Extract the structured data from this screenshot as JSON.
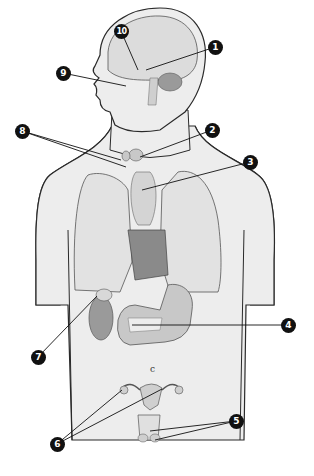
{
  "diagram": {
    "colors": {
      "skin_fill": "#ededed",
      "outline": "#2a2a2a",
      "organ_fill": "#cfcfcf",
      "organ_dark": "#9a9a9a",
      "label_bg": "#111111",
      "label_text": "#ffffff",
      "background": "#ffffff"
    },
    "labels": [
      {
        "id": "1",
        "x": 215,
        "y": 47,
        "target": "pituitary region (brain)"
      },
      {
        "id": "2",
        "x": 212,
        "y": 130,
        "target": "thyroid gland"
      },
      {
        "id": "3",
        "x": 250,
        "y": 162,
        "target": "thymus"
      },
      {
        "id": "4",
        "x": 288,
        "y": 325,
        "target": "pancreas"
      },
      {
        "id": "5",
        "x": 236,
        "y": 421,
        "target": "testes"
      },
      {
        "id": "6",
        "x": 57,
        "y": 444,
        "target": "ovaries"
      },
      {
        "id": "7",
        "x": 38,
        "y": 357,
        "target": "adrenal gland / kidney"
      },
      {
        "id": "8",
        "x": 22,
        "y": 131,
        "target": "parathyroid glands"
      },
      {
        "id": "9",
        "x": 63,
        "y": 73,
        "target": "pineal / eye region"
      },
      {
        "id": "10",
        "x": 121,
        "y": 31,
        "target": "hypothalamus"
      }
    ]
  }
}
